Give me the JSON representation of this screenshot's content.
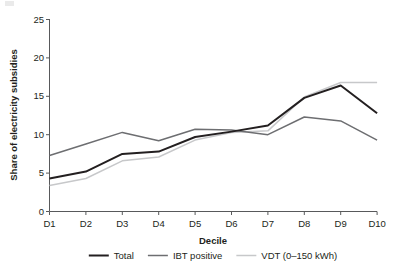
{
  "chart_data": {
    "type": "line",
    "title": "",
    "xlabel": "Decile",
    "ylabel": "Share of electricity subsidies",
    "categories": [
      "D1",
      "D2",
      "D3",
      "D4",
      "D5",
      "D6",
      "D7",
      "D8",
      "D9",
      "D10"
    ],
    "ylim": [
      0,
      25
    ],
    "yticks": [
      0,
      5,
      10,
      15,
      20,
      25
    ],
    "grid": false,
    "legend_position": "bottom",
    "series": [
      {
        "name": "Total",
        "color": "#231f20",
        "values": [
          4.3,
          5.2,
          7.5,
          7.8,
          9.7,
          10.4,
          11.2,
          14.8,
          16.4,
          12.8
        ]
      },
      {
        "name": "IBT positive",
        "color": "#6d6e71",
        "values": [
          7.3,
          8.8,
          10.3,
          9.2,
          10.7,
          10.6,
          10.0,
          12.3,
          11.8,
          9.3
        ]
      },
      {
        "name": "VDT (0–150 kWh)",
        "color": "#c7c8ca",
        "values": [
          3.4,
          4.3,
          6.6,
          7.1,
          9.3,
          10.3,
          10.5,
          14.9,
          16.8,
          16.8
        ]
      }
    ]
  },
  "axis": {
    "y_title": "Share of electricity subsidies",
    "x_title": "Decile",
    "y_tick_labels": [
      "0",
      "5",
      "10",
      "15",
      "20",
      "25"
    ],
    "x_tick_labels": [
      "D1",
      "D2",
      "D3",
      "D4",
      "D5",
      "D6",
      "D7",
      "D8",
      "D9",
      "D10"
    ]
  },
  "legend": {
    "items": [
      {
        "label": "Total",
        "color": "#231f20"
      },
      {
        "label": "IBT positive",
        "color": "#6d6e71"
      },
      {
        "label": "VDT (0–150 kWh)",
        "color": "#c7c8ca"
      }
    ]
  },
  "colors": {
    "total": "#231f20",
    "ibt_positive": "#6d6e71",
    "vdt": "#c7c8ca",
    "axis": "#58595b",
    "text": "#231f20",
    "background": "#ffffff"
  }
}
